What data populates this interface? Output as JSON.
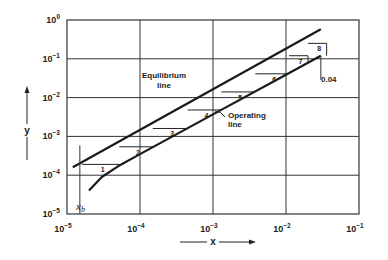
{
  "chart_data": {
    "type": "line",
    "title": "",
    "xlabel": "x",
    "ylabel": "y",
    "xscale": "log",
    "yscale": "log",
    "xlim": [
      1e-05,
      0.1
    ],
    "ylim": [
      1e-05,
      1.0
    ],
    "grid": true,
    "x_ticks": [
      {
        "value": 1e-05,
        "base": "10",
        "exp": "-5"
      },
      {
        "value": 0.0001,
        "base": "10",
        "exp": "-4"
      },
      {
        "value": 0.001,
        "base": "10",
        "exp": "-3"
      },
      {
        "value": 0.01,
        "base": "10",
        "exp": "-2"
      },
      {
        "value": 0.1,
        "base": "10",
        "exp": "-1"
      }
    ],
    "y_ticks": [
      {
        "value": 1.0,
        "base": "10",
        "exp": "0"
      },
      {
        "value": 0.1,
        "base": "10",
        "exp": "-1"
      },
      {
        "value": 0.01,
        "base": "10",
        "exp": "-2"
      },
      {
        "value": 0.001,
        "base": "10",
        "exp": "-3"
      },
      {
        "value": 0.0001,
        "base": "10",
        "exp": "-4"
      },
      {
        "value": 1e-05,
        "base": "10",
        "exp": "-5"
      }
    ],
    "series": [
      {
        "name": "Equilibrium line",
        "points": [
          [
            1.2e-05,
            0.00016
          ],
          [
            0.03,
            0.58
          ]
        ]
      },
      {
        "name": "Operating line",
        "points": [
          [
            2e-05,
            4e-05
          ],
          [
            3e-05,
            9e-05
          ],
          [
            5e-05,
            0.00017
          ],
          [
            0.0001,
            0.00035
          ],
          [
            0.001,
            0.0037
          ],
          [
            0.01,
            0.039
          ],
          [
            0.03,
            0.12
          ]
        ]
      }
    ],
    "stages": [
      {
        "label": "1",
        "x_left": 1.6e-05,
        "x_right": 5.2e-05,
        "y": 0.00019
      },
      {
        "label": "2",
        "x_left": 5.2e-05,
        "x_right": 0.00015,
        "y": 0.00054
      },
      {
        "label": "3",
        "x_left": 0.00015,
        "x_right": 0.00045,
        "y": 0.0016
      },
      {
        "label": "4",
        "x_left": 0.00045,
        "x_right": 0.0013,
        "y": 0.0048
      },
      {
        "label": "5",
        "x_left": 0.0013,
        "x_right": 0.0038,
        "y": 0.014
      },
      {
        "label": "6",
        "x_left": 0.0038,
        "x_right": 0.011,
        "y": 0.041
      },
      {
        "label": "7",
        "x_left": 0.011,
        "x_right": 0.02,
        "y": 0.12
      },
      {
        "label": "8",
        "x_left": 0.02,
        "x_right": 0.036,
        "y": 0.25
      }
    ],
    "annotations": {
      "equilibrium": "Equilibrium\nline",
      "equilibrium_line1": "Equilibrium",
      "equilibrium_line2": "line",
      "operating_line1": "Operating",
      "operating_line2": "line",
      "x_top": "0.04",
      "x_bottom": "x",
      "x_bottom_sub": "b",
      "xb_value": 1.5e-05,
      "x_top_value": 0.04
    }
  }
}
